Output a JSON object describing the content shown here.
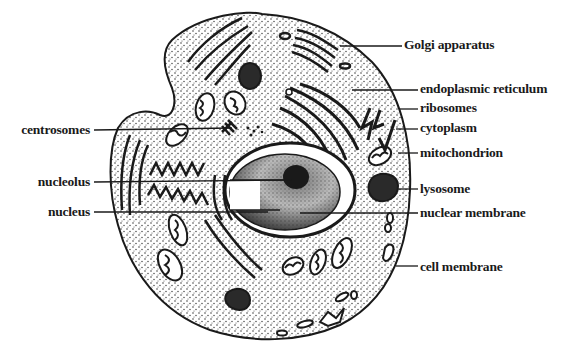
{
  "diagram": {
    "colors": {
      "ink": "#1a1a1a",
      "background": "#ffffff",
      "cytoplasm_dots": "#333333",
      "dark_fill": "#2a2a2a"
    },
    "labels_right": [
      {
        "id": "golgi",
        "text": "Golgi apparatus"
      },
      {
        "id": "er",
        "text": "endoplasmic reticulum"
      },
      {
        "id": "ribosomes",
        "text": "ribosomes"
      },
      {
        "id": "cytoplasm",
        "text": "cytoplasm"
      },
      {
        "id": "mitochondrion",
        "text": "mitochondrion"
      },
      {
        "id": "lysosome",
        "text": "lysosome"
      },
      {
        "id": "nuclear-membrane",
        "text": "nuclear membrane"
      },
      {
        "id": "cell-membrane",
        "text": "cell membrane"
      }
    ],
    "labels_left": [
      {
        "id": "centrosomes",
        "text": "centrosomes"
      },
      {
        "id": "nucleolus",
        "text": "nucleolus"
      },
      {
        "id": "nucleus",
        "text": "nucleus"
      }
    ]
  }
}
